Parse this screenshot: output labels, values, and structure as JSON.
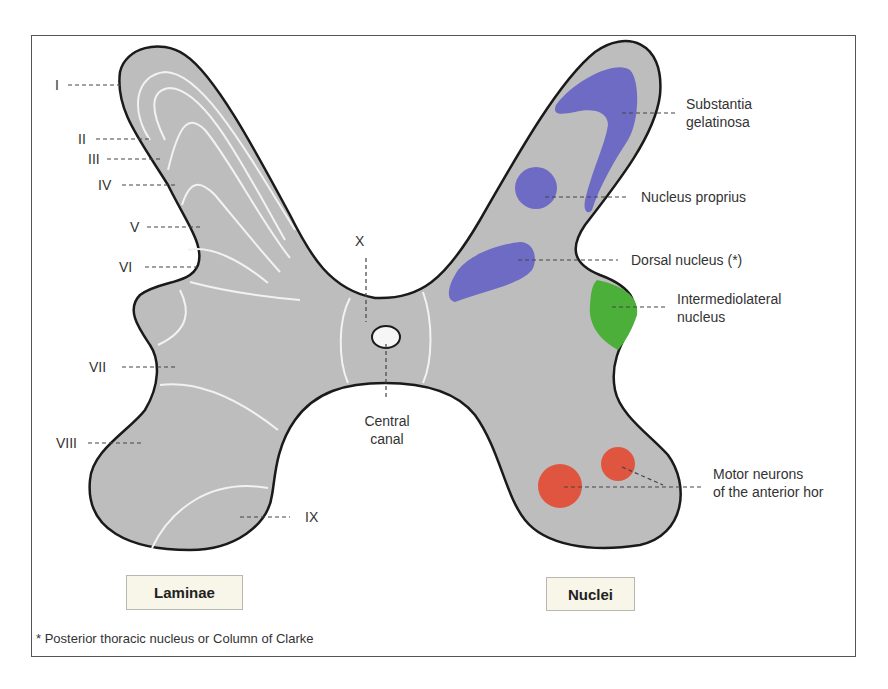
{
  "laminae": {
    "title": "Laminae",
    "labels": [
      "I",
      "II",
      "III",
      "IV",
      "V",
      "VI",
      "VII",
      "VIII",
      "IX",
      "X"
    ]
  },
  "nuclei": {
    "title": "Nuclei",
    "labels": {
      "substantia_line1": "Substantia",
      "substantia_line2": "gelatinosa",
      "proprius": "Nucleus proprius",
      "dorsal": "Dorsal nucleus (*)",
      "intermedio_line1": "Intermediolateral",
      "intermedio_line2": "nucleus",
      "motor_line1": "Motor neurons",
      "motor_line2": "of the anterior hor"
    },
    "colors": {
      "sensory": "#6e6bc4",
      "autonomic": "#4caf3a",
      "motor": "#e0553f"
    }
  },
  "central_canal": {
    "line1": "Central",
    "line2": "canal"
  },
  "footnote": "* Posterior thoracic nucleus or Column of Clarke",
  "colors": {
    "gray_matter": "#bdbdbd",
    "outline": "#1a1a1a",
    "lamina_lines": "#f2f2f2",
    "legend_fill": "#f7f6e8"
  }
}
